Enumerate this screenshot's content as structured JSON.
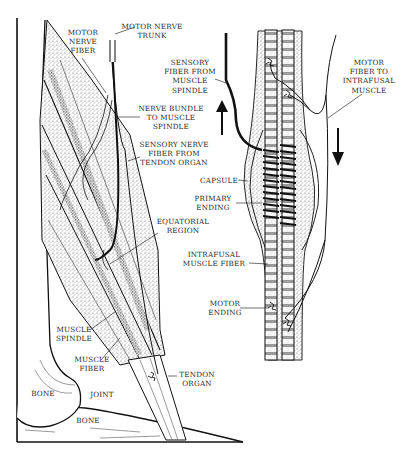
{
  "figure": {
    "caption_visible": false
  },
  "left_panel": {
    "labels": {
      "motor_nerve_fiber": "MOTOR\nNERVE\nFIBER",
      "motor_nerve_trunk": "MOTOR NERVE\nTRUNK",
      "nerve_bundle": "NERVE BUNDLE\nTO MUSCLE\nSPINDLE",
      "sensory_nerve_fiber": "SENSORY NERVE\nFIBER FROM\nTENDON ORGAN",
      "equatorial_region": "EQUATORIAL\nREGION",
      "muscle_spindle": "MUSCLE\nSPINDLE",
      "muscle_fiber": "MUSCLE\nFIBER",
      "tendon_organ": "TENDON\nORGAN",
      "bone_upper": "BONE",
      "joint": "JOINT",
      "bone_lower": "BONE"
    }
  },
  "right_panel": {
    "labels": {
      "sensory_fiber": "SENSORY\nFIBER FROM\nMUSCLE\nSPINDLE",
      "motor_fiber": "MOTOR\nFIBER TO\nINTRAFUSAL\nMUSCLE",
      "capsule": "CAPSULE",
      "primary_ending": "PRIMARY\nENDING",
      "intrafusal_fiber": "INTRAFUSAL\nMUSCLE FIBER",
      "motor_ending": "MOTOR\nENDING"
    },
    "arrows": {
      "afferent": "up-arrow",
      "efferent": "down-arrow"
    }
  },
  "colors": {
    "ink": "#1a1a1a",
    "stipple": "#8a8a8a",
    "paper": "#ffffff"
  }
}
